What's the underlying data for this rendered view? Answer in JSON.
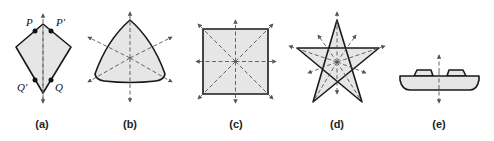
{
  "figure": {
    "panels": [
      {
        "id": "a",
        "caption": "(a)",
        "shape": "kite",
        "points": {
          "P": "P",
          "P_prime": "P′",
          "Q_prime": "Q′",
          "Q": "Q"
        }
      },
      {
        "id": "b",
        "caption": "(b)",
        "shape": "curved-triangle"
      },
      {
        "id": "c",
        "caption": "(c)",
        "shape": "square"
      },
      {
        "id": "d",
        "caption": "(d)",
        "shape": "pentagram"
      },
      {
        "id": "e",
        "caption": "(e)",
        "shape": "plate-with-tabs"
      }
    ],
    "colors": {
      "fill": "#e6e6e6",
      "stroke": "#1a1a1a",
      "axis": "#555555"
    }
  }
}
